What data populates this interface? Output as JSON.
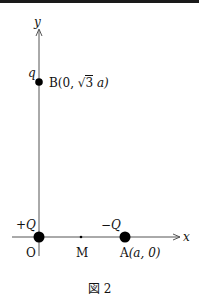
{
  "figure": {
    "caption": "図 2",
    "axes": {
      "x_label": "x",
      "y_label": "y"
    },
    "points": {
      "origin": {
        "name": "O",
        "charge": "+Q"
      },
      "midpoint": {
        "name": "M"
      },
      "A": {
        "name": "A",
        "coords": "(a, 0)",
        "charge": "−Q"
      },
      "B": {
        "name": "B",
        "coords_prefix": "(0, ",
        "sqrt_arg": "3",
        "coords_suffix": " a)",
        "charge": "q"
      }
    },
    "colors": {
      "line": "#555555",
      "dot": "#000000",
      "border": "#1a1a1a"
    }
  }
}
